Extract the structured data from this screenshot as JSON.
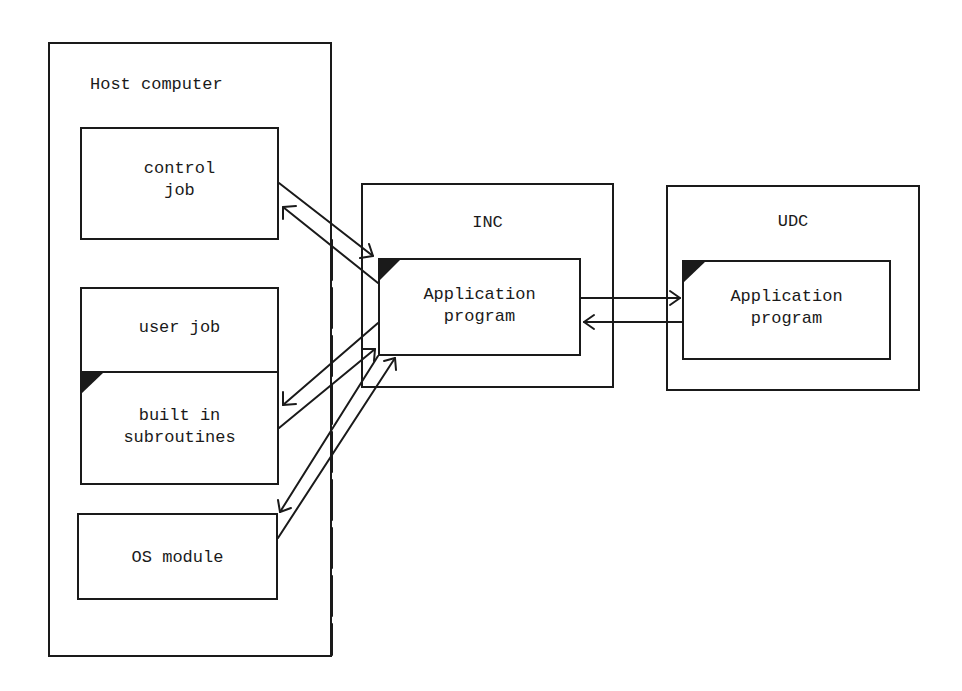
{
  "diagram": {
    "host": {
      "title": "Host computer",
      "control_job": "control\njob",
      "user_job": "user job",
      "builtin": "built in\nsubroutines",
      "os_module": "OS module"
    },
    "inc": {
      "title": "INC",
      "app": "Application\nprogram"
    },
    "udc": {
      "title": "UDC",
      "app": "Application\nprogram"
    }
  },
  "colors": {
    "line": "#1a1a1a",
    "background": "#ffffff"
  }
}
